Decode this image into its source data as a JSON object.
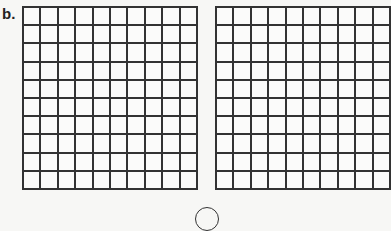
{
  "label": "b.",
  "grids": [
    {
      "id": "left",
      "rows": 10,
      "cols": 10
    },
    {
      "id": "right",
      "rows": 10,
      "cols": 10
    }
  ]
}
